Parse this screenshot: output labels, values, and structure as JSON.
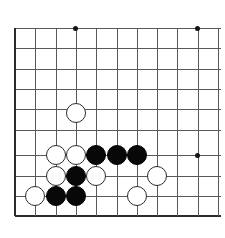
{
  "figure": {
    "kind": "go-board-diagram",
    "title": "",
    "corner": "lower-left",
    "background_color": "#ffffff",
    "line_color": "#595959",
    "edge_color": "#2b2b2b",
    "black_stone_color": "#080808",
    "white_stone_color": "#ffffff"
  },
  "board": {
    "visible_columns": 11,
    "visible_rows": 10,
    "cell_size_px": 20.3,
    "origin_x_px": 15,
    "origin_y_px": 28,
    "stone_diameter_px": 20,
    "column_x_px": [
      15,
      35.3,
      55.6,
      75.9,
      96.2,
      116.5,
      136.8,
      157.1,
      177.4,
      197.7,
      218
    ],
    "row_y_px": [
      28,
      48.3,
      68.6,
      88.9,
      109.2,
      129.5,
      155,
      175.8,
      196.1,
      216.4
    ],
    "edges": {
      "left_x_px": 15,
      "bottom_y_px": 216.4
    },
    "hoshi_points": [
      {
        "name": "hoshi-top-left",
        "x_px": 75.9,
        "y_px": 28
      },
      {
        "name": "hoshi-top-right",
        "x_px": 197.7,
        "y_px": 28
      },
      {
        "name": "hoshi-lower-right",
        "x_px": 197.7,
        "y_px": 155
      }
    ],
    "stones": [
      {
        "id": "stone-white-1",
        "color": "white",
        "x_px": 75.9,
        "y_px": 113
      },
      {
        "id": "stone-white-2",
        "color": "white",
        "x_px": 55.6,
        "y_px": 155
      },
      {
        "id": "stone-white-3",
        "color": "white",
        "x_px": 75.9,
        "y_px": 155
      },
      {
        "id": "stone-black-1",
        "color": "black",
        "x_px": 96.2,
        "y_px": 155
      },
      {
        "id": "stone-black-2",
        "color": "black",
        "x_px": 116.5,
        "y_px": 155
      },
      {
        "id": "stone-black-3",
        "color": "black",
        "x_px": 136.8,
        "y_px": 155
      },
      {
        "id": "stone-white-4",
        "color": "white",
        "x_px": 55.6,
        "y_px": 175.8
      },
      {
        "id": "stone-black-4",
        "color": "black",
        "x_px": 75.9,
        "y_px": 175.8
      },
      {
        "id": "stone-white-5",
        "color": "white",
        "x_px": 96.2,
        "y_px": 175.8
      },
      {
        "id": "stone-white-6",
        "color": "white",
        "x_px": 157.1,
        "y_px": 175.8
      },
      {
        "id": "stone-white-7",
        "color": "white",
        "x_px": 35.3,
        "y_px": 196.1
      },
      {
        "id": "stone-black-5",
        "color": "black",
        "x_px": 55.6,
        "y_px": 196.1
      },
      {
        "id": "stone-black-6",
        "color": "black",
        "x_px": 75.9,
        "y_px": 196.1
      },
      {
        "id": "stone-white-8",
        "color": "white",
        "x_px": 136.8,
        "y_px": 196.1
      }
    ],
    "stone_counts": {
      "black": 6,
      "white": 8,
      "total": 14
    }
  }
}
